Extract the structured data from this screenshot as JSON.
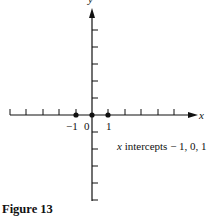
{
  "figure": {
    "caption": "Figure 13",
    "axes": {
      "x_label": "x",
      "y_label": "y",
      "x_tick_labels": [
        "-1",
        "0",
        "1"
      ],
      "x_ticks_left": 5,
      "x_ticks_right": 5,
      "y_ticks_up": 5,
      "y_ticks_down": 5
    },
    "points": [
      {
        "x": -1,
        "y": 0
      },
      {
        "x": 0,
        "y": 0
      },
      {
        "x": 1,
        "y": 0
      }
    ],
    "annotation": {
      "var": "x",
      "text": " intercepts − 1, 0, 1"
    },
    "tick_label_minus1": "−1",
    "tick_label_0": "0",
    "tick_label_1": "1"
  }
}
